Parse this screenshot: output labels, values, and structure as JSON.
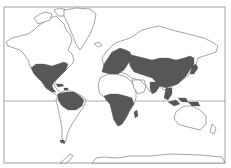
{
  "map": {
    "type": "world-distribution-map",
    "projection": "mercator",
    "style": "black-and-white outline with gray shading",
    "colors": {
      "background": "#ffffff",
      "land_outline": "#6a6a6a",
      "range_fill": "#575757",
      "frame": "#8a8a8a"
    },
    "reference_lines": [
      {
        "name": "equator",
        "y": 101
      }
    ],
    "frame": {
      "x": 4,
      "y": 7,
      "width": 221,
      "height": 156
    },
    "shaded_regions": [
      {
        "id": "north-america",
        "label": "Eastern & southern North America, Mexico, Central America"
      },
      {
        "id": "caribbean",
        "label": "Caribbean islands"
      },
      {
        "id": "south-america-north",
        "label": "Northern South America"
      },
      {
        "id": "south-america-tip",
        "label": "Southern tip of South America"
      },
      {
        "id": "europe",
        "label": "Europe"
      },
      {
        "id": "asia",
        "label": "Northern & eastern Asia"
      },
      {
        "id": "japan",
        "label": "Japan"
      },
      {
        "id": "india",
        "label": "Indian subcontinent"
      },
      {
        "id": "southeast-asia",
        "label": "Southeast Asia"
      },
      {
        "id": "indonesia",
        "label": "Indonesia / New Guinea"
      },
      {
        "id": "africa",
        "label": "Sub-Saharan Africa"
      },
      {
        "id": "madagascar",
        "label": "Madagascar"
      }
    ]
  }
}
